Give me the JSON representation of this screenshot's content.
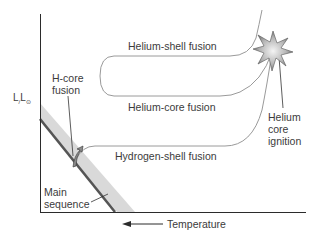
{
  "diagram": {
    "type": "HR diagram evolutionary track",
    "y_axis": {
      "label_main": "L",
      "label_sep": "/",
      "label_denom": "L",
      "label_sub": "⊙"
    },
    "x_axis": {
      "label": "Temperature",
      "arrow_direction": "left"
    },
    "labels": {
      "helium_shell": "Helium-shell fusion",
      "helium_core": "Helium-core fusion",
      "hydrogen_shell": "Hydrogen-shell fusion",
      "h_core": "H-core\nfusion",
      "main_sequence": "Main\nsequence",
      "helium_ignition": "Helium\ncore\nignition"
    },
    "colors": {
      "axis": "#2b2b2b",
      "track": "#9a9a9a",
      "band": "#d6d6d6",
      "main_line": "#555555",
      "text": "#3b3b3b",
      "star_light": "#f2f2f2",
      "star_dark": "#6e6e6e"
    },
    "icons": {
      "star": "helium-flash-star-icon",
      "arrow": "track-arrow-icon"
    }
  }
}
